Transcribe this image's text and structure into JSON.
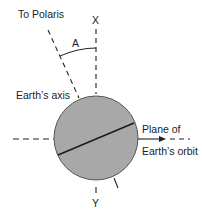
{
  "diagram": {
    "labels": {
      "polaris": "To Polaris",
      "x": "X",
      "angle": "A",
      "axis": "Earth’s axis",
      "plane_line1": "Plane of",
      "plane_line2": "Earth’s orbit",
      "y": "Y"
    },
    "colors": {
      "earth_fill": "#a8a8a8",
      "earth_stroke": "#555555",
      "line": "#222222",
      "background": "#ffffff"
    }
  }
}
